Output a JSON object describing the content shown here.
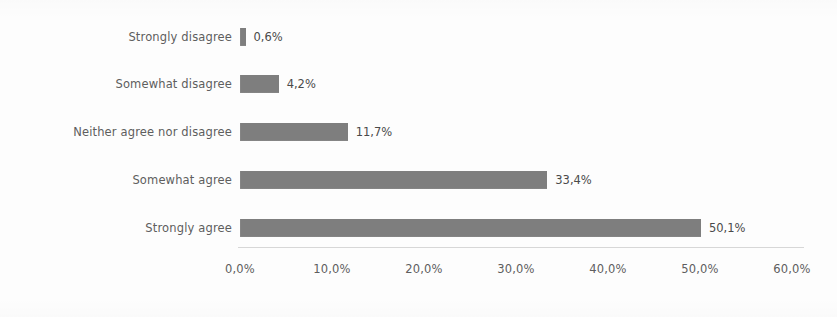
{
  "chart_data": {
    "type": "bar",
    "orientation": "horizontal",
    "title": "",
    "subtitle": "",
    "xlabel": "",
    "ylabel": "",
    "categories": [
      "Strongly disagree",
      "Somewhat disagree",
      "Neither agree nor disagree",
      "Somewhat agree",
      "Strongly agree"
    ],
    "values": [
      0.6,
      4.2,
      11.7,
      33.4,
      50.1
    ],
    "value_labels": [
      "0,6%",
      "4,2%",
      "11,7%",
      "33,4%",
      "50,1%"
    ],
    "xlim": [
      0,
      60
    ],
    "xticks": [
      0,
      10,
      20,
      30,
      40,
      50,
      60
    ],
    "xtick_labels": [
      "0,0%",
      "10,0%",
      "20,0%",
      "30,0%",
      "40,0%",
      "50,0%",
      "60,0%"
    ],
    "decimal_separator": ",",
    "grid": false,
    "legend": false,
    "legend_position": "none",
    "bar_color": "#7e7e7e",
    "text_color": "#5e5e5e",
    "value_label_color": "#4a4a4a",
    "axis_line_color": "#d7d7d7",
    "background_color": "#fdfdfd"
  }
}
